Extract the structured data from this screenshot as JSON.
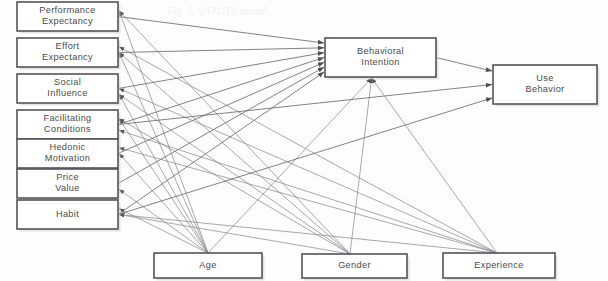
{
  "diagram": {
    "title": "UTAUT2 Model",
    "type": "path-diagram",
    "canvas": {
      "width": 608,
      "height": 281
    },
    "colors": {
      "background": "#fdfdfd",
      "box_border": "#555358",
      "box_fill": "#ffffff",
      "edge": "#6d6b70",
      "label_text": "#4a4a4f"
    },
    "ghost_artifact": "Fig. 1. UTAUT2 model"
  },
  "predictors": [
    {
      "id": "performance-expectancy",
      "label_line1": "Performance",
      "label_line2": "Expectancy",
      "x": 17,
      "y": 2,
      "w": 101,
      "h": 29
    },
    {
      "id": "effort-expectancy",
      "label_line1": "Effort",
      "label_line2": "Expectancy",
      "x": 17,
      "y": 38,
      "w": 101,
      "h": 29
    },
    {
      "id": "social-influence",
      "label_line1": "Social",
      "label_line2": "Influence",
      "x": 17,
      "y": 74,
      "w": 101,
      "h": 29
    },
    {
      "id": "facilitating-conditions",
      "label_line1": "Facilitating",
      "label_line2": "Conditions",
      "x": 17,
      "y": 110,
      "w": 101,
      "h": 29
    },
    {
      "id": "hedonic-motivation",
      "label_line1": "Hedonic",
      "label_line2": "Motivation",
      "x": 17,
      "y": 139,
      "w": 101,
      "h": 29
    },
    {
      "id": "price-value",
      "label_line1": "Price",
      "label_line2": "Value",
      "x": 17,
      "y": 169,
      "w": 101,
      "h": 29
    },
    {
      "id": "habit",
      "label_line1": "Habit",
      "label_line2": "",
      "x": 17,
      "y": 200,
      "w": 101,
      "h": 29
    }
  ],
  "outcomes": [
    {
      "id": "behavioral-intention",
      "label_line1": "Behavioral",
      "label_line2": "Intention",
      "x": 325,
      "y": 38,
      "w": 111,
      "h": 39
    },
    {
      "id": "use-behavior",
      "label_line1": "Use",
      "label_line2": "Behavior",
      "x": 493,
      "y": 65,
      "w": 104,
      "h": 39
    }
  ],
  "moderators": [
    {
      "id": "age",
      "label_line1": "Age",
      "label_line2": "",
      "x": 154,
      "y": 253,
      "w": 108,
      "h": 25,
      "fan_x": 208,
      "fan_y": 253
    },
    {
      "id": "gender",
      "label_line1": "Gender",
      "label_line2": "",
      "x": 302,
      "y": 254,
      "w": 105,
      "h": 24,
      "fan_x": 350,
      "fan_y": 254
    },
    {
      "id": "experience",
      "label_line1": "Experience",
      "label_line2": "",
      "x": 443,
      "y": 253,
      "w": 112,
      "h": 25,
      "fan_x": 497,
      "fan_y": 253
    }
  ],
  "edges": {
    "predictor_to_bi": [
      {
        "from": "performance-expectancy",
        "to": "behavioral-intention"
      },
      {
        "from": "effort-expectancy",
        "to": "behavioral-intention"
      },
      {
        "from": "social-influence",
        "to": "behavioral-intention"
      },
      {
        "from": "facilitating-conditions",
        "to": "behavioral-intention"
      },
      {
        "from": "hedonic-motivation",
        "to": "behavioral-intention"
      },
      {
        "from": "price-value",
        "to": "behavioral-intention"
      },
      {
        "from": "habit",
        "to": "behavioral-intention"
      }
    ],
    "to_use_behavior": [
      {
        "from": "behavioral-intention",
        "to": "use-behavior"
      },
      {
        "from": "facilitating-conditions",
        "to": "use-behavior"
      },
      {
        "from": "habit",
        "to": "use-behavior"
      }
    ],
    "moderator_targets": {
      "age": [
        "performance-expectancy",
        "effort-expectancy",
        "social-influence",
        "facilitating-conditions",
        "hedonic-motivation",
        "price-value",
        "habit",
        "behavioral-intention"
      ],
      "gender": [
        "performance-expectancy",
        "effort-expectancy",
        "social-influence",
        "facilitating-conditions",
        "habit",
        "behavioral-intention"
      ],
      "experience": [
        "effort-expectancy",
        "social-influence",
        "facilitating-conditions",
        "hedonic-motivation",
        "habit",
        "behavioral-intention"
      ]
    }
  }
}
